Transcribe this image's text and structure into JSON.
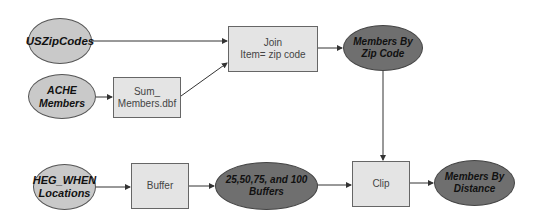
{
  "diagram": {
    "type": "flowchart",
    "colors": {
      "input_ellipse_fill": "#c9c9c9",
      "output_ellipse_fill": "#6f6f6f",
      "process_box_fill": "#e4e4e4",
      "edge": "#333333"
    },
    "nodes": {
      "uszipcodes": {
        "label": "USZipCodes",
        "shape": "ellipse",
        "style": "input"
      },
      "ache_members": {
        "label": "ACHE Members",
        "shape": "ellipse",
        "style": "input"
      },
      "sum_members": {
        "label": "Sum_\nMembers.dbf",
        "shape": "rectangle",
        "style": "process"
      },
      "join": {
        "label": "Join\nItem= zip code",
        "shape": "rectangle",
        "style": "process"
      },
      "members_by_zip": {
        "label": "Members By\nZip Code",
        "shape": "ellipse",
        "style": "output"
      },
      "heg_when": {
        "label": "HEG_WHEN\nLocations",
        "shape": "ellipse",
        "style": "input"
      },
      "buffer": {
        "label": "Buffer",
        "shape": "rectangle",
        "style": "process"
      },
      "buffers_out": {
        "label": "25,50,75, and 100\nBuffers",
        "shape": "ellipse",
        "style": "output"
      },
      "clip": {
        "label": "Clip",
        "shape": "rectangle",
        "style": "process"
      },
      "members_by_distance": {
        "label": "Members By\nDistance",
        "shape": "ellipse",
        "style": "output"
      }
    },
    "edges": [
      {
        "from": "uszipcodes",
        "to": "join"
      },
      {
        "from": "ache_members",
        "to": "sum_members"
      },
      {
        "from": "sum_members",
        "to": "join"
      },
      {
        "from": "join",
        "to": "members_by_zip"
      },
      {
        "from": "members_by_zip",
        "to": "clip"
      },
      {
        "from": "heg_when",
        "to": "buffer"
      },
      {
        "from": "buffer",
        "to": "buffers_out"
      },
      {
        "from": "buffers_out",
        "to": "clip"
      },
      {
        "from": "clip",
        "to": "members_by_distance"
      }
    ]
  }
}
